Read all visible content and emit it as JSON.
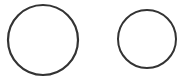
{
  "diagram": {
    "background": "#ffffff",
    "stroke_color": "#333333",
    "shapes": [
      {
        "type": "circle",
        "name": "large-circle",
        "cx": 43,
        "cy": 40,
        "r": 35,
        "stroke_width": 2.2,
        "fill": "none"
      },
      {
        "type": "circle",
        "name": "small-circle",
        "cx": 147,
        "cy": 39,
        "r": 29,
        "stroke_width": 2,
        "fill": "none"
      }
    ]
  }
}
